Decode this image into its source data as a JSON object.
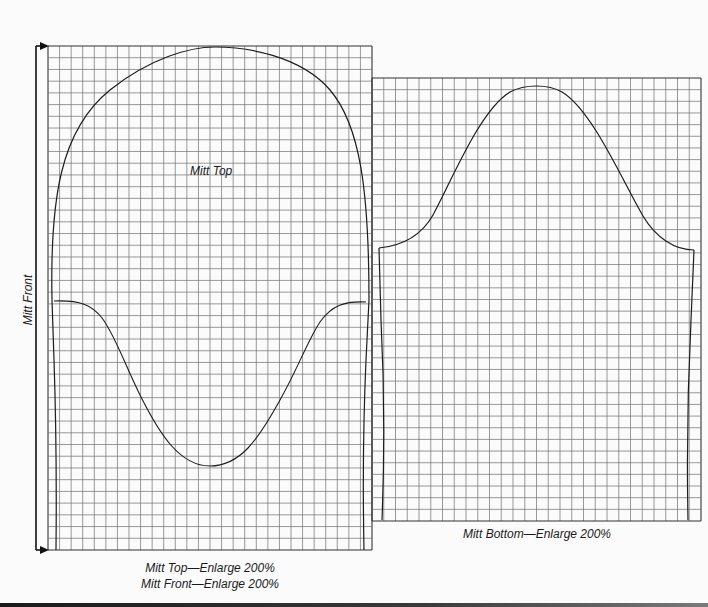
{
  "patterns": {
    "mitt_top": {
      "label": "Mitt Top",
      "grid": {
        "x": 48,
        "y": 46,
        "width": 324,
        "height": 504,
        "cols": 28,
        "rows": 43
      }
    },
    "mitt_bottom": {
      "label": "Mitt Bottom",
      "grid": {
        "x": 372,
        "y": 78,
        "width": 329,
        "height": 443,
        "cols": 28,
        "rows": 38
      }
    }
  },
  "labels": {
    "mitt_top": "Mitt Top",
    "mitt_front_side": "Mitt Front",
    "caption_left_line1": "Mitt Top—Enlarge 200%",
    "caption_left_line2": "Mitt Front—Enlarge 200%",
    "caption_right": "Mitt Bottom—Enlarge 200%"
  },
  "colors": {
    "background": "#fbfbfb",
    "grid_line": "#6e6e6e",
    "outline": "#1c1c1c"
  }
}
